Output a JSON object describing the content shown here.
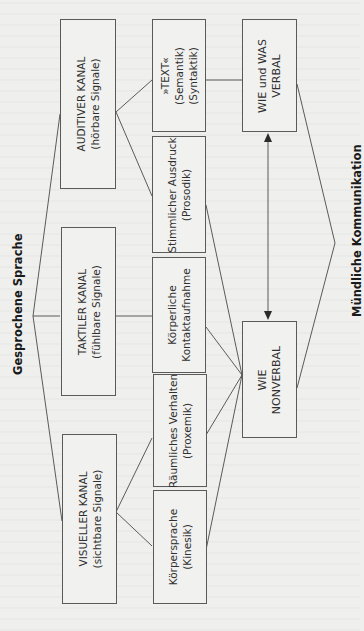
{
  "diagram": {
    "left_group_label": "Gesprochene Sprache",
    "right_group_label": "Mündliche Kommunikation",
    "channels": [
      {
        "line1": "AUDITIVER KANAL",
        "line2": "(hörbare Signale)"
      },
      {
        "line1": "TAKTILER KANAL",
        "line2": "(fühlbare Signale)"
      },
      {
        "line1": "VISUELLER KANAL",
        "line2": "(sichtbare Signale)"
      }
    ],
    "signals": [
      {
        "line1": "»TEXT«",
        "line2": "(Semantik)",
        "line3": "(Syntaktik)"
      },
      {
        "line1": "Stimmlicher Ausdruck",
        "line2": "(Prosodik)"
      },
      {
        "line1": "Körperliche",
        "line2": "Kontaktaufnahme"
      },
      {
        "line1": "Räumliches Verhalten",
        "line2": "(Proxemik)"
      },
      {
        "line1": "Körpersprache",
        "line2": "(Kinesik)"
      }
    ],
    "outcomes": [
      {
        "line1": "WIE und WAS",
        "line2": "VERBAL"
      },
      {
        "line1": "WIE",
        "line2": "NONVERBAL"
      }
    ],
    "colors": {
      "line": "#4a4a4a",
      "box_border": "#5a5a5a",
      "background": "#efefed"
    }
  }
}
